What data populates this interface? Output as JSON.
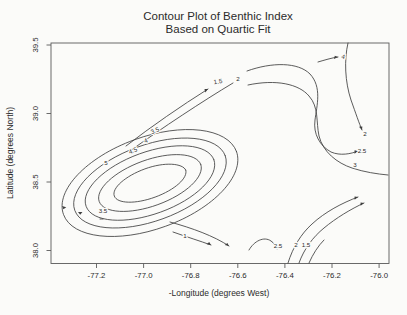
{
  "title": {
    "line1": "Contour Plot of Benthic Index",
    "line2": "Based on Quartic Fit"
  },
  "chart_data": {
    "type": "contour",
    "title": "Contour Plot of Benthic Index Based on Quartic Fit",
    "xlabel": "-Longitude (degrees West)",
    "ylabel": "Latitude (degrees North)",
    "xlim": [
      -77.39,
      -75.95
    ],
    "ylim": [
      37.97,
      39.52
    ],
    "grid": false,
    "legend": "none",
    "contour_levels": [
      1,
      1.5,
      2,
      2.5,
      3,
      3.5,
      4,
      4.5,
      5
    ],
    "x_ticks": [
      {
        "label": "-77.2",
        "px": 96.5
      },
      {
        "label": "-77.0",
        "px": 143.6
      },
      {
        "label": "-76.8",
        "px": 190.7
      },
      {
        "label": "-76.6",
        "px": 237.8
      },
      {
        "label": "-76.4",
        "px": 284.9
      },
      {
        "label": "-76.2",
        "px": 332.0
      },
      {
        "label": "-76.0",
        "px": 379.1
      }
    ],
    "y_ticks": [
      {
        "label": "39.5",
        "px": 45.0
      },
      {
        "label": "39.0",
        "px": 113.5
      },
      {
        "label": "38.5",
        "px": 182.0
      },
      {
        "label": "38.0",
        "px": 250.5
      }
    ],
    "plot_box_px": {
      "x": 51,
      "y": 43,
      "w": 338,
      "h": 220.5
    },
    "colors": {
      "curve": "#3f3f3f",
      "text": "#2b2b2b",
      "background": "#fbfbf9",
      "frame": "#5a5a5a"
    },
    "curves": [
      {
        "level": 3.5,
        "label": "3.5",
        "lx": 155,
        "ly": 131,
        "rot": -22,
        "d": "M236.5,151.5 C245.2,175.4 213.5,208.8 165.7,226.2 C117.9,243.6 72.2,238.4 63.5,214.5 C54.8,190.6 86.5,157.2 134.3,139.8 C182.1,122.4 227.8,127.6 236.5,151.5"
      },
      {
        "level": 4,
        "label": "4",
        "lx": 146,
        "ly": 141,
        "rot": -22,
        "d": "M225.2,155.6 C232.4,175.3 204.5,203.6 163,218.7 C121.5,233.8 82,230.1 74.8,210.4 C67.6,190.7 95.5,162.4 137,147.3 C178.5,132.2 218,135.9 225.2,155.6"
      },
      {
        "level": 4.5,
        "label": "4.5",
        "lx": 133,
        "ly": 151,
        "rot": -22,
        "d": "M213.9,159.7 C219.8,175.8 195.9,199.3 160.6,212.1 C125.3,224.9 92,222.4 86.1,206.3 C80.2,190.2 104.1,166.7 139.4,153.9 C174.7,141.1 208,143.6 213.9,159.7"
      },
      {
        "level": 5,
        "label": "5",
        "lx": 106,
        "ly": 163,
        "rot": 0,
        "d": "M200.8,164.5 C205.1,176.4 185.9,194.4 157.9,204.6 C129.9,214.8 103.5,213.4 99.2,201.5 C94.9,189.6 114.1,171.6 142.1,161.4 C170.1,151.2 196.5,152.6 200.8,164.5"
      },
      {
        "level": null,
        "label": null,
        "d": "M185.7,170 C188.5,177.8 174.8,189.9 155.1,197.1 C135.4,204.3 117.1,203.8 114.3,196 C111.5,188.2 125.2,176.1 144.9,168.9 C164.6,161.7 182.9,163.2 185.7,170"
      },
      {
        "level": 3.5,
        "label": "3.5",
        "lx": 103,
        "ly": 211,
        "rot": 0,
        "d": "M100,219 C101,219 102,219 103,219"
      },
      {
        "level": 1.5,
        "label": "1.5",
        "lx": 218,
        "ly": 82,
        "rot": -10,
        "d": "M126,146 C152,126 181,106 208,89"
      },
      {
        "level": 2,
        "label": "2",
        "lx": 238,
        "ly": 79,
        "rot": 0,
        "d": "M130,151 C162,128 203,101 233,83"
      },
      {
        "level": 1,
        "label": "1",
        "lx": 185,
        "ly": 236,
        "rot": 0,
        "d": "M170,222 C192,228 214,236 229,246"
      },
      {
        "level": null,
        "label": null,
        "d": "M173,232 C187,237 200,241 211,245"
      },
      {
        "level": 2.5,
        "label": "2.5",
        "lx": 278,
        "ly": 246,
        "rot": 0,
        "d": "M249,250 C254,241 264,236 271,241 C274,243 276,246 277,249"
      },
      {
        "level": 2,
        "label": "2",
        "lx": 296,
        "ly": 245,
        "rot": 0,
        "d": "M288,263 C293,247 301,234 312,224 C325,212 342,203 358,197"
      },
      {
        "level": 1.5,
        "label": "1.5",
        "lx": 306,
        "ly": 245,
        "rot": 0,
        "d": "M299,263 C304,249 313,237 324,228 C336,218 351,209 364,203"
      },
      {
        "level": null,
        "label": null,
        "d": "M309,263 C313,254 318,246 324,240"
      },
      {
        "level": 2.5,
        "label": "2.5",
        "lx": 362,
        "ly": 151,
        "rot": 0,
        "d": "M247,71 C272,62 298,62 310,74 C322,87 317,105 315,120 C313,134 320,146 331,152 C340,156 351,154 358,151"
      },
      {
        "level": 3,
        "label": "3",
        "lx": 355,
        "ly": 165,
        "rot": 0,
        "d": "M248,85 C276,79 299,84 309,96 C319,107 316,122 319,136 C323,152 337,163 352,168 C364,172 377,174 388,175"
      },
      {
        "level": 2,
        "label": "2",
        "lx": 365,
        "ly": 134,
        "rot": 0,
        "d": "M348,43 C344,60 345,82 351,100 C356,114 359,123 362,130"
      },
      {
        "level": 4,
        "label": "4",
        "lx": 343,
        "ly": 57,
        "rot": 15,
        "d": "M318,62 C325,60 331,58 338,57"
      }
    ],
    "arrow_marks": [
      {
        "x": 208,
        "y": 89,
        "a": -33
      },
      {
        "x": 229,
        "y": 246,
        "a": 32
      },
      {
        "x": 211,
        "y": 245,
        "a": 28
      },
      {
        "x": 358,
        "y": 197,
        "a": -22
      },
      {
        "x": 364,
        "y": 203,
        "a": -22
      },
      {
        "x": 358,
        "y": 151,
        "a": -20
      },
      {
        "x": 362,
        "y": 130,
        "a": 65
      },
      {
        "x": 338,
        "y": 57,
        "a": -8
      },
      {
        "x": 62,
        "y": 206,
        "a": 215
      },
      {
        "x": 78,
        "y": 212,
        "a": 200
      }
    ]
  }
}
